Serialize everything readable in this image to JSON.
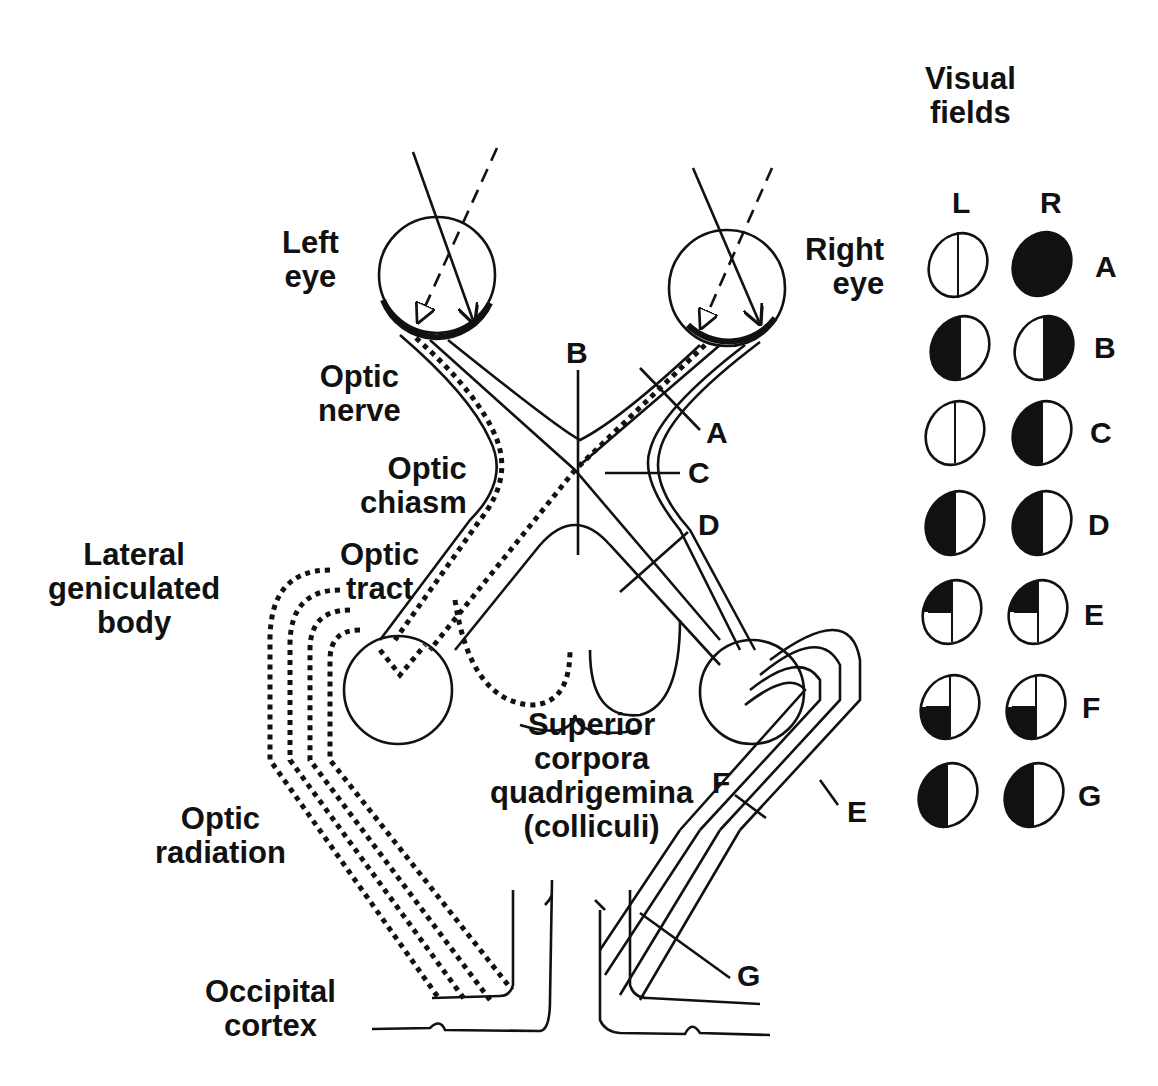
{
  "labels": {
    "left_eye": "Left\neye",
    "right_eye": "Right\neye",
    "optic_nerve": "Optic\nnerve",
    "optic_chiasm": "Optic\nchiasm",
    "optic_tract": "Optic\ntract",
    "lateral_geniculate_body": "Lateral\ngeniculated\nbody",
    "superior_corpora_quadrigemina": "Superior\ncorpora\nquadrigemina\n(colliculi)",
    "optic_radiation": "Optic\nradiation",
    "occipital_cortex": "Occipital\ncortex"
  },
  "lesion_markers": [
    "A",
    "B",
    "C",
    "D",
    "E",
    "F",
    "G"
  ],
  "visual_fields": {
    "title": "Visual\nfields",
    "column_left": "L",
    "column_right": "R",
    "rows": [
      {
        "label": "A",
        "left": "normal",
        "right": "full-blind"
      },
      {
        "label": "B",
        "left": "temporal-hemianopia (left half black)",
        "right": "temporal-hemianopia (right half black)"
      },
      {
        "label": "C",
        "left": "normal",
        "right": "nasal-hemianopia (left half black)"
      },
      {
        "label": "D",
        "left": "left half black",
        "right": "left half black"
      },
      {
        "label": "E",
        "left": "upper-left quadrant black",
        "right": "upper-left quadrant black"
      },
      {
        "label": "F",
        "left": "lower-left quadrant black",
        "right": "lower-left quadrant black"
      },
      {
        "label": "G",
        "left": "left half black",
        "right": "left half black"
      }
    ]
  }
}
